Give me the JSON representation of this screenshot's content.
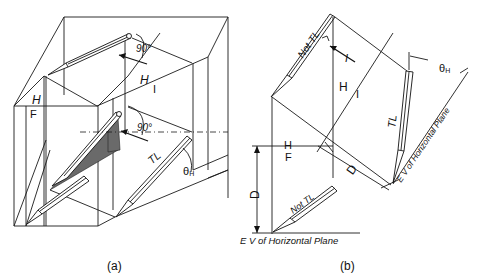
{
  "figure_a": {
    "caption": "(a)",
    "labels": {
      "angle_top": "90°",
      "angle_mid": "90°",
      "plane_hi_h": "H",
      "plane_hi_i": "I",
      "plane_hf_h": "H",
      "plane_hf_f": "F",
      "true_length": "TL",
      "theta": "θ",
      "theta_sub": "H"
    }
  },
  "figure_b": {
    "caption": "(b)",
    "labels": {
      "not_tl_top": "Not TL",
      "not_tl_bottom": "Not TL",
      "view_arrow": "I",
      "plane_hi_h": "H",
      "plane_hi_i": "I",
      "plane_hf_h": "H",
      "plane_hf_f": "F",
      "true_length": "TL",
      "theta": "θ",
      "theta_sub": "H",
      "dist_left": "D",
      "dist_right": "D",
      "ev_horizontal_rotated": "E V of Horizontal Plane",
      "ev_horizontal_bottom": "E V of Horizontal Plane"
    }
  }
}
